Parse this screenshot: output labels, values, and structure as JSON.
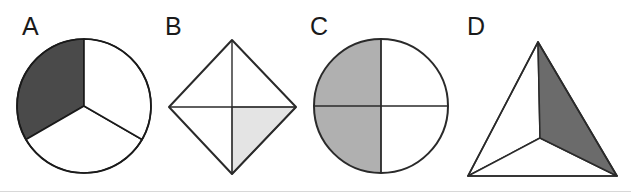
{
  "figure": {
    "caption": "",
    "background_color": "#ffffff",
    "outline_color": "#1a1a1a",
    "panels": [
      {
        "id": "A",
        "label": "A",
        "label_x": 22,
        "label_y": 35,
        "shape": "circle",
        "shape_name": "circle-divided-in-thirds",
        "center_x": 84,
        "center_y": 106,
        "radius": 67,
        "divisions": 3,
        "division_type": "radial-sectors",
        "shaded_parts": 1,
        "total_parts": 3,
        "fraction": "1/3",
        "fill_color": "#4a4a4a",
        "unshaded_color": "#ffffff",
        "sector_angles_deg": [
          90,
          210,
          330
        ],
        "shaded_sector_index": 0
      },
      {
        "id": "B",
        "label": "B",
        "label_x": 165,
        "label_y": 35,
        "shape": "diamond",
        "shape_name": "diamond-divided-in-quarters",
        "top_x": 232,
        "top_y": 40,
        "right_x": 296,
        "right_y": 107,
        "bottom_x": 232,
        "bottom_y": 174,
        "left_x": 169,
        "left_y": 107,
        "center_x": 232,
        "center_y": 107,
        "divisions": 4,
        "division_type": "vertical-and-horizontal-bisectors",
        "shaded_parts": 1,
        "total_parts": 4,
        "fraction": "1/4",
        "fill_color": "#e4e4e4",
        "unshaded_color": "#ffffff",
        "shaded_quadrant": "bottom-right"
      },
      {
        "id": "C",
        "label": "C",
        "label_x": 310,
        "label_y": 35,
        "shape": "circle",
        "shape_name": "circle-divided-in-quarters",
        "center_x": 381,
        "center_y": 106,
        "radius": 67,
        "divisions": 4,
        "division_type": "vertical-and-horizontal-diameters",
        "shaded_parts": 2,
        "total_parts": 4,
        "fraction": "2/4",
        "fill_color": "#b0b0b0",
        "unshaded_color": "#ffffff",
        "shaded_quadrants": [
          "top-left",
          "bottom-left"
        ]
      },
      {
        "id": "D",
        "label": "D",
        "label_x": 467,
        "label_y": 35,
        "shape": "triangle",
        "shape_name": "triangle-divided-in-thirds",
        "apex_x": 538,
        "apex_y": 42,
        "bottom_left_x": 468,
        "bottom_left_y": 176,
        "bottom_right_x": 617,
        "bottom_right_y": 176,
        "interior_x": 540,
        "interior_y": 138,
        "divisions": 3,
        "division_type": "cevians-from-interior-point",
        "shaded_parts": 1,
        "total_parts": 3,
        "fraction": "1/3",
        "fill_color": "#6b6b6b",
        "unshaded_color": "#ffffff",
        "shaded_region": "right"
      }
    ]
  }
}
